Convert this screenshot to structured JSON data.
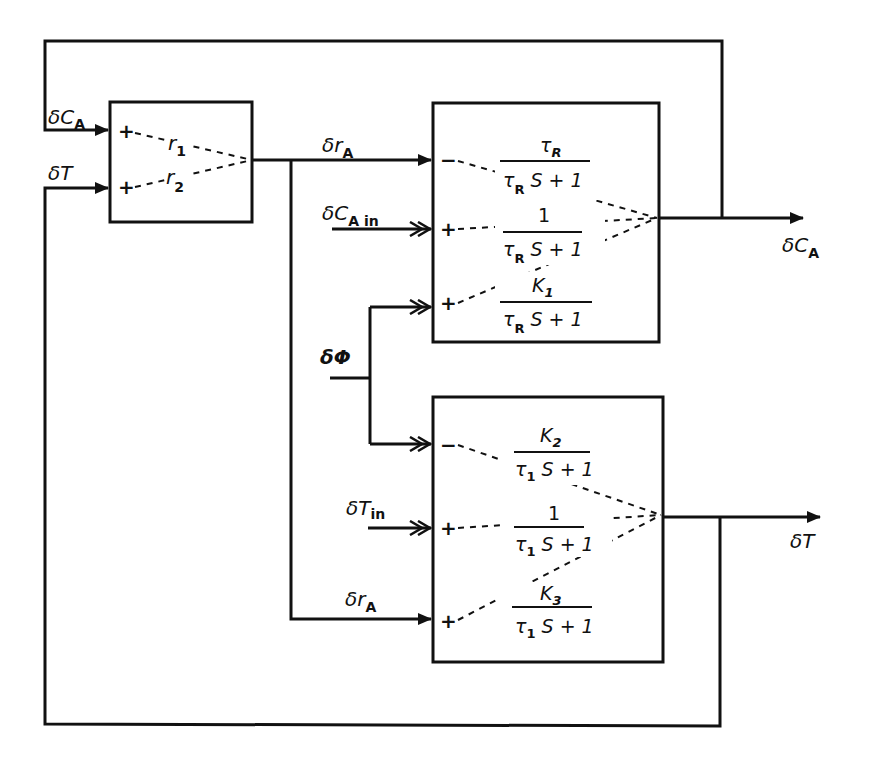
{
  "diagram": {
    "type": "block-diagram",
    "signals": {
      "dCA_feedback": {
        "delta": "δ",
        "var": "C",
        "sub": "A"
      },
      "dT_feedback": {
        "delta": "δ",
        "var": "T",
        "sub": ""
      },
      "drA_top": {
        "delta": "δ",
        "var": "r",
        "sub": "A"
      },
      "dCAin": {
        "delta": "δ",
        "var": "C",
        "sub": "A in"
      },
      "dPhi": {
        "delta": "δ",
        "var": "Φ",
        "sub": ""
      },
      "dTin": {
        "delta": "δ",
        "var": "T",
        "sub": "in"
      },
      "drA_bottom": {
        "delta": "δ",
        "var": "r",
        "sub": "A"
      },
      "dCA_out": {
        "delta": "δ",
        "var": "C",
        "sub": "A"
      },
      "dT_out": {
        "delta": "δ",
        "var": "T",
        "sub": ""
      }
    },
    "block_rate": {
      "inputs": [
        {
          "sign": "+",
          "gain_var": "r",
          "gain_sub": "1"
        },
        {
          "sign": "+",
          "gain_var": "r",
          "gain_sub": "2"
        }
      ]
    },
    "block_concentration": {
      "inputs": [
        {
          "sign": "−",
          "num": "τ",
          "num_sub": "R",
          "den_a": "τ",
          "den_sub": "R",
          "den_b": " S + 1"
        },
        {
          "sign": "+",
          "num": "1",
          "num_sub": "",
          "den_a": "τ",
          "den_sub": "R",
          "den_b": " S + 1"
        },
        {
          "sign": "+",
          "num": "K",
          "num_sub": "1",
          "den_a": "τ",
          "den_sub": "R",
          "den_b": " S + 1"
        }
      ]
    },
    "block_temperature": {
      "inputs": [
        {
          "sign": "−",
          "num": "K",
          "num_sub": "2",
          "den_a": "τ",
          "den_sub": "1",
          "den_b": " S + 1"
        },
        {
          "sign": "+",
          "num": "1",
          "num_sub": "",
          "den_a": "τ",
          "den_sub": "1",
          "den_b": " S + 1"
        },
        {
          "sign": "+",
          "num": "K",
          "num_sub": "3",
          "den_a": "τ",
          "den_sub": "1",
          "den_b": " S + 1"
        }
      ]
    }
  }
}
